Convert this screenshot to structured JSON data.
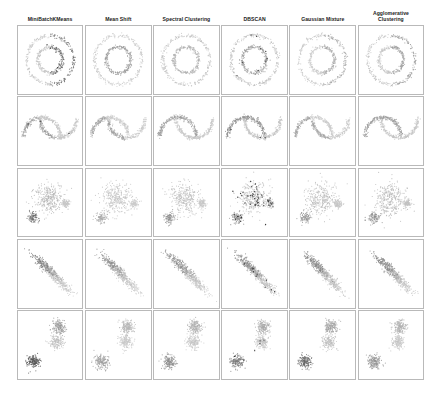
{
  "figure": {
    "title": "",
    "columns": [
      {
        "id": "minibatch-kmeans",
        "label": "MiniBatchKMeans"
      },
      {
        "id": "mean-shift",
        "label": "Mean Shift"
      },
      {
        "id": "spectral-clustering",
        "label": "Spectral Clustering"
      },
      {
        "id": "dbscan",
        "label": "DBSCAN"
      },
      {
        "id": "gaussian-mixture",
        "label": "Gaussian Mixture"
      },
      {
        "id": "agglomerative-clustering",
        "label": "Agglomerative\nClustering"
      }
    ],
    "rows": [
      {
        "id": "noisy-circles",
        "label": "noisy_circles"
      },
      {
        "id": "noisy-moons",
        "label": "noisy_moons"
      },
      {
        "id": "varied-blobs",
        "label": "varied_blobs"
      },
      {
        "id": "aniso",
        "label": "aniso"
      },
      {
        "id": "blobs",
        "label": "blobs"
      }
    ]
  },
  "palette": {
    "point_dark": "#3a3a3a",
    "point_mid": "#8c8c8c",
    "point_light": "#c2c2c2",
    "point_pale": "#d9d9d9",
    "noise": "#2b2b2b",
    "panel_border": "#b9b9b9",
    "background": "#ffffff"
  },
  "chart_data": {
    "type": "scatter",
    "title": "",
    "xlabel": "",
    "ylabel": "",
    "grid": false,
    "legend": null,
    "xlim": [
      -2.6,
      2.6
    ],
    "ylim": [
      -2.6,
      2.6
    ],
    "layout": {
      "rows": 5,
      "cols": 6,
      "panel_count": 30
    },
    "row_datasets": [
      "noisy_circles",
      "noisy_moons",
      "varied_blobs",
      "aniso",
      "blobs"
    ],
    "col_algorithms": [
      "MiniBatchKMeans",
      "Mean Shift",
      "Spectral Clustering",
      "DBSCAN",
      "Gaussian Mixture",
      "Agglomerative Clustering"
    ],
    "points_per_panel": 500,
    "panels": [
      {
        "row": "noisy_circles",
        "col": "MiniBatchKMeans",
        "shape": "two_rings",
        "clusters": 2,
        "cluster_tones": [
          "#c2c2c2",
          "#6b6b6b"
        ],
        "split": "vertical_halves",
        "noise_points": 6
      },
      {
        "row": "noisy_circles",
        "col": "Mean Shift",
        "shape": "two_rings",
        "clusters": 2,
        "cluster_tones": [
          "#c8c8c8",
          "#9a9a9a"
        ],
        "split": "radial",
        "noise_points": 0
      },
      {
        "row": "noisy_circles",
        "col": "Spectral Clustering",
        "shape": "two_rings",
        "clusters": 2,
        "cluster_tones": [
          "#c2c2c2",
          "#b0b0b0"
        ],
        "split": "radial",
        "noise_points": 0
      },
      {
        "row": "noisy_circles",
        "col": "DBSCAN",
        "shape": "two_rings",
        "clusters": 2,
        "cluster_tones": [
          "#bdbdbd",
          "#9e9e9e"
        ],
        "split": "radial",
        "noise_points": 10
      },
      {
        "row": "noisy_circles",
        "col": "Gaussian Mixture",
        "shape": "two_rings",
        "clusters": 2,
        "cluster_tones": [
          "#c8c8c8",
          "#a8a8a8"
        ],
        "split": "vertical_halves",
        "noise_points": 0
      },
      {
        "row": "noisy_circles",
        "col": "Agglomerative Clustering",
        "shape": "two_rings",
        "clusters": 2,
        "cluster_tones": [
          "#c4c4c4",
          "#9c9c9c"
        ],
        "split": "vertical_halves",
        "noise_points": 0
      },
      {
        "row": "noisy_moons",
        "col": "MiniBatchKMeans",
        "shape": "two_moons",
        "clusters": 2,
        "cluster_tones": [
          "#9a9a9a",
          "#c4c4c4"
        ],
        "split": "diagonal",
        "noise_points": 3
      },
      {
        "row": "noisy_moons",
        "col": "Mean Shift",
        "shape": "two_moons",
        "clusters": 2,
        "cluster_tones": [
          "#a0a0a0",
          "#c8c8c8"
        ],
        "split": "diagonal",
        "noise_points": 0
      },
      {
        "row": "noisy_moons",
        "col": "Spectral Clustering",
        "shape": "two_moons",
        "clusters": 2,
        "cluster_tones": [
          "#9e9e9e",
          "#c6c6c6"
        ],
        "split": "by_moon",
        "noise_points": 0
      },
      {
        "row": "noisy_moons",
        "col": "DBSCAN",
        "shape": "two_moons",
        "clusters": 2,
        "cluster_tones": [
          "#8f8f8f",
          "#c2c2c2"
        ],
        "split": "by_moon",
        "noise_points": 4
      },
      {
        "row": "noisy_moons",
        "col": "Gaussian Mixture",
        "shape": "two_moons",
        "clusters": 2,
        "cluster_tones": [
          "#a2a2a2",
          "#cacaca"
        ],
        "split": "diagonal",
        "noise_points": 0
      },
      {
        "row": "noisy_moons",
        "col": "Agglomerative Clustering",
        "shape": "two_moons",
        "clusters": 2,
        "cluster_tones": [
          "#9c9c9c",
          "#c4c4c4"
        ],
        "split": "by_moon",
        "noise_points": 0
      },
      {
        "row": "varied_blobs",
        "col": "MiniBatchKMeans",
        "shape": "three_varied_blobs",
        "clusters": 3,
        "cluster_tones": [
          "#b4b4b4",
          "#6e6e6e",
          "#c6c6c6"
        ],
        "noise_points": 0
      },
      {
        "row": "varied_blobs",
        "col": "Mean Shift",
        "shape": "three_varied_blobs",
        "clusters": 3,
        "cluster_tones": [
          "#c0c0c0",
          "#a8a8a8",
          "#cccccc"
        ],
        "noise_points": 0
      },
      {
        "row": "varied_blobs",
        "col": "Spectral Clustering",
        "shape": "three_varied_blobs",
        "clusters": 3,
        "cluster_tones": [
          "#bcbcbc",
          "#8e8e8e",
          "#c8c8c8"
        ],
        "noise_points": 0
      },
      {
        "row": "varied_blobs",
        "col": "DBSCAN",
        "shape": "three_varied_blobs",
        "clusters": 3,
        "cluster_tones": [
          "#b8b8b8",
          "#8a8a8a",
          "#c4c4c4"
        ],
        "noise_points": 55
      },
      {
        "row": "varied_blobs",
        "col": "Gaussian Mixture",
        "shape": "three_varied_blobs",
        "clusters": 3,
        "cluster_tones": [
          "#bababa",
          "#949494",
          "#c6c6c6"
        ],
        "noise_points": 0
      },
      {
        "row": "varied_blobs",
        "col": "Agglomerative Clustering",
        "shape": "three_varied_blobs",
        "clusters": 3,
        "cluster_tones": [
          "#b6b6b6",
          "#8c8c8c",
          "#c2c2c2"
        ],
        "noise_points": 0
      },
      {
        "row": "aniso",
        "col": "MiniBatchKMeans",
        "shape": "three_aniso",
        "clusters": 3,
        "cluster_tones": [
          "#7a7a7a",
          "#b0b0b0",
          "#cacaca"
        ],
        "noise_points": 0
      },
      {
        "row": "aniso",
        "col": "Mean Shift",
        "shape": "three_aniso",
        "clusters": 3,
        "cluster_tones": [
          "#8e8e8e",
          "#b8b8b8",
          "#cccccc"
        ],
        "noise_points": 0
      },
      {
        "row": "aniso",
        "col": "Spectral Clustering",
        "shape": "three_aniso",
        "clusters": 3,
        "cluster_tones": [
          "#8a8a8a",
          "#b4b4b4",
          "#c8c8c8"
        ],
        "noise_points": 0
      },
      {
        "row": "aniso",
        "col": "DBSCAN",
        "shape": "three_aniso",
        "clusters": 3,
        "cluster_tones": [
          "#868686",
          "#b2b2b2",
          "#c6c6c6"
        ],
        "noise_points": 12
      },
      {
        "row": "aniso",
        "col": "Gaussian Mixture",
        "shape": "three_aniso",
        "clusters": 3,
        "cluster_tones": [
          "#808080",
          "#aeaeae",
          "#c4c4c4"
        ],
        "noise_points": 0
      },
      {
        "row": "aniso",
        "col": "Agglomerative Clustering",
        "shape": "three_aniso",
        "clusters": 3,
        "cluster_tones": [
          "#848484",
          "#b0b0b0",
          "#c6c6c6"
        ],
        "noise_points": 0
      },
      {
        "row": "blobs",
        "col": "MiniBatchKMeans",
        "shape": "three_blobs",
        "clusters": 3,
        "cluster_tones": [
          "#555555",
          "#9a9a9a",
          "#c0c0c0"
        ],
        "noise_points": 0
      },
      {
        "row": "blobs",
        "col": "Mean Shift",
        "shape": "three_blobs",
        "clusters": 3,
        "cluster_tones": [
          "#9e9e9e",
          "#b4b4b4",
          "#c8c8c8"
        ],
        "noise_points": 0
      },
      {
        "row": "blobs",
        "col": "Spectral Clustering",
        "shape": "three_blobs",
        "clusters": 3,
        "cluster_tones": [
          "#8e8e8e",
          "#aeaeae",
          "#c4c4c4"
        ],
        "noise_points": 0
      },
      {
        "row": "blobs",
        "col": "DBSCAN",
        "shape": "three_blobs",
        "clusters": 3,
        "cluster_tones": [
          "#7c7c7c",
          "#a8a8a8",
          "#c2c2c2"
        ],
        "noise_points": 6
      },
      {
        "row": "blobs",
        "col": "Gaussian Mixture",
        "shape": "three_blobs",
        "clusters": 3,
        "cluster_tones": [
          "#6a6a6a",
          "#a2a2a2",
          "#bebebe"
        ],
        "noise_points": 0
      },
      {
        "row": "blobs",
        "col": "Agglomerative Clustering",
        "shape": "three_blobs",
        "clusters": 3,
        "cluster_tones": [
          "#929292",
          "#b0b0b0",
          "#c6c6c6"
        ],
        "noise_points": 0
      }
    ]
  }
}
